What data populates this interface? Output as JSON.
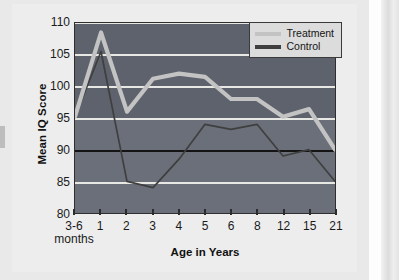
{
  "chart_data": {
    "type": "line",
    "title": "",
    "xlabel": "Age in Years",
    "ylabel": "Mean IQ Score",
    "ylim": [
      80,
      110
    ],
    "y_ticks": [
      80,
      85,
      90,
      95,
      100,
      105,
      110
    ],
    "grid": true,
    "legend_position": "top-right",
    "categories": [
      "3-6 months",
      "1",
      "2",
      "3",
      "4",
      "5",
      "6",
      "8",
      "12",
      "15",
      "21"
    ],
    "series": [
      {
        "name": "Treatment",
        "color": "#c3c3c3",
        "values": [
          95.2,
          108.5,
          96.0,
          101.2,
          102.0,
          101.5,
          98.0,
          98.0,
          95.2,
          96.4,
          90.0
        ]
      },
      {
        "name": "Control",
        "color": "#3f3f3f",
        "values": [
          95.2,
          105.5,
          85.0,
          84.0,
          88.5,
          94.0,
          93.2,
          94.0,
          89.0,
          90.0,
          85.0
        ]
      }
    ]
  },
  "axes": {
    "y_title": "Mean IQ Score",
    "x_title": "Age in Years",
    "y_tick_labels": [
      "110",
      "105",
      "100",
      "95",
      "90",
      "85",
      "80"
    ],
    "x_tick_labels": [
      {
        "main": "3-6",
        "sub": "months"
      },
      {
        "main": "1",
        "sub": ""
      },
      {
        "main": "2",
        "sub": ""
      },
      {
        "main": "3",
        "sub": ""
      },
      {
        "main": "4",
        "sub": ""
      },
      {
        "main": "5",
        "sub": ""
      },
      {
        "main": "6",
        "sub": ""
      },
      {
        "main": "8",
        "sub": ""
      },
      {
        "main": "12",
        "sub": ""
      },
      {
        "main": "15",
        "sub": ""
      },
      {
        "main": "21",
        "sub": ""
      }
    ]
  },
  "legend": {
    "items": [
      {
        "label": "Treatment",
        "color": "#c3c3c3"
      },
      {
        "label": "Control",
        "color": "#3f3f3f"
      }
    ]
  },
  "colors": {
    "plot_background_upper": "#5d626c",
    "plot_background_lower": "#6a6f79",
    "gridline": "#e7e7e4",
    "gridline_highlight": "#141414",
    "page_background": "#ededed",
    "treatment": "#c3c3c3",
    "control": "#3f3f3f"
  }
}
